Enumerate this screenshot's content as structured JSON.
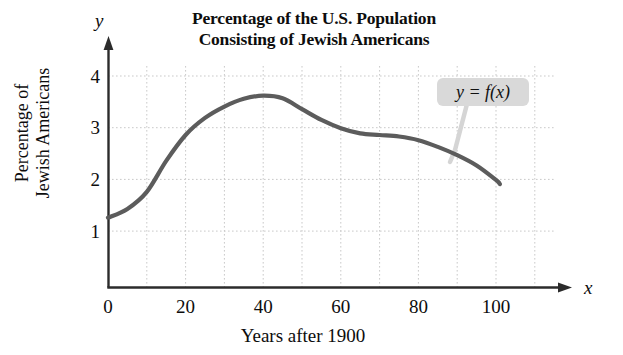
{
  "chart_data": {
    "type": "line",
    "title": "Percentage of the U.S. Population Consisting of Jewish Americans",
    "title_lines": [
      "Percentage of the U.S. Population",
      "Consisting of Jewish Americans"
    ],
    "xlabel": "Years after 1900",
    "ylabel": "Percentage of Jewish Americans",
    "ylabel_lines": [
      "Percentage of",
      "Jewish Americans"
    ],
    "x_axis_letter": "x",
    "y_axis_letter": "y",
    "xlim": [
      0,
      112
    ],
    "ylim": [
      0,
      4.45
    ],
    "x_ticks": [
      0,
      20,
      40,
      60,
      80,
      100
    ],
    "x_tick_labels": [
      "0",
      "20",
      "40",
      "60",
      "80",
      "100"
    ],
    "y_ticks": [
      1,
      2,
      3,
      4
    ],
    "y_tick_labels": [
      "1",
      "2",
      "3",
      "4"
    ],
    "x_minor_gridlines": [
      10,
      20,
      30,
      40,
      50,
      60,
      70,
      80,
      90,
      100,
      110
    ],
    "y_gridlines": [
      1,
      2,
      3,
      4
    ],
    "grid": true,
    "grid_style": "dotted",
    "legend": "none",
    "annotation": "y = f(x)",
    "curve_color": "#5c5c5c",
    "axis_color": "#2b2b2b",
    "grid_color": "#c9c9c9",
    "callout_bg": "#d9d9d9",
    "series": [
      {
        "name": "f(x)",
        "x": [
          0,
          5,
          10,
          15,
          20,
          25,
          30,
          35,
          40,
          45,
          50,
          55,
          60,
          65,
          70,
          75,
          80,
          85,
          90,
          95,
          100,
          101
        ],
        "values": [
          1.35,
          1.52,
          1.85,
          2.45,
          2.95,
          3.28,
          3.5,
          3.65,
          3.71,
          3.66,
          3.45,
          3.24,
          3.08,
          2.98,
          2.95,
          2.92,
          2.85,
          2.72,
          2.56,
          2.36,
          2.08,
          2.0
        ]
      }
    ]
  },
  "chart": {
    "title_lines": {
      "line1": "Percentage of the U.S. Population",
      "line2": "Consisting of Jewish Americans"
    },
    "axis_letters": {
      "x": "x",
      "y": "y"
    },
    "x_axis_title": "Years after 1900",
    "y_axis_title": {
      "line1": "Percentage of",
      "line2": "Jewish Americans"
    },
    "x_tick_labels": [
      "0",
      "20",
      "40",
      "60",
      "80",
      "100"
    ],
    "y_tick_labels": [
      "1",
      "2",
      "3",
      "4"
    ],
    "annotation": "y = f(x)"
  }
}
